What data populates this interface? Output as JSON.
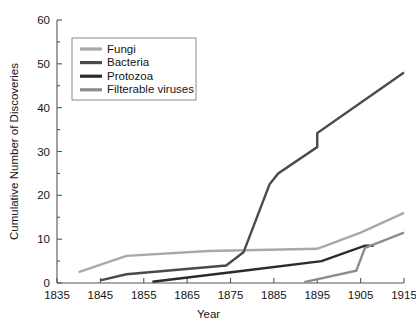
{
  "chart_data": {
    "type": "line",
    "title": "",
    "xlabel": "Year",
    "ylabel": "Cumulative Number of Discoveries",
    "xlim": [
      1835,
      1915
    ],
    "ylim": [
      0,
      60
    ],
    "xticks": [
      1835,
      1845,
      1855,
      1865,
      1875,
      1885,
      1895,
      1905,
      1915
    ],
    "yticks": [
      0,
      10,
      20,
      30,
      40,
      50,
      60
    ],
    "yminorticks": [
      5,
      15,
      25,
      35,
      45,
      55
    ],
    "grid": false,
    "legend_position": "upper-left-inset",
    "series": [
      {
        "name": "Fungi",
        "color": "#a8a8a8",
        "points": [
          [
            1840,
            2.5
          ],
          [
            1851,
            6.2
          ],
          [
            1870,
            7.3
          ],
          [
            1895,
            7.8
          ],
          [
            1905,
            11.5
          ],
          [
            1915,
            16.0
          ]
        ]
      },
      {
        "name": "Bacteria",
        "color": "#4a4a4a",
        "points": [
          [
            1845,
            0.6
          ],
          [
            1851,
            2.0
          ],
          [
            1874,
            4.0
          ],
          [
            1878,
            7.0
          ],
          [
            1884,
            22.5
          ],
          [
            1886,
            25.0
          ],
          [
            1895,
            31.0
          ],
          [
            1895,
            34.2
          ],
          [
            1915,
            48.0
          ]
        ]
      },
      {
        "name": "Protozoa",
        "color": "#2b2b2b",
        "points": [
          [
            1857,
            0.3
          ],
          [
            1878,
            2.8
          ],
          [
            1896,
            5.0
          ],
          [
            1906,
            8.5
          ],
          [
            1908,
            8.5
          ]
        ]
      },
      {
        "name": "Filterable viruses",
        "color": "#8c8c8c",
        "points": [
          [
            1892,
            0.2
          ],
          [
            1904,
            2.8
          ],
          [
            1906,
            8.0
          ],
          [
            1915,
            11.5
          ]
        ]
      }
    ]
  },
  "legend": {
    "entries": [
      {
        "label": "Fungi",
        "color": "#a8a8a8"
      },
      {
        "label": "Bacteria",
        "color": "#4a4a4a"
      },
      {
        "label": "Protozoa",
        "color": "#2b2b2b"
      },
      {
        "label": "Filterable viruses",
        "color": "#8c8c8c"
      }
    ]
  }
}
